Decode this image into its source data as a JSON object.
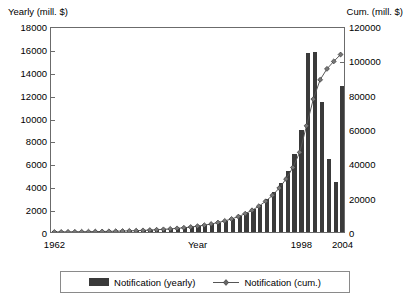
{
  "chart_data": {
    "type": "bar",
    "title": "",
    "xlabel": "Year",
    "ylabel": "Yearly (mill. $)",
    "y2label": "Cum. (mill. $)",
    "ylim": [
      0,
      18000
    ],
    "y2lim": [
      0,
      120000
    ],
    "yticks": [
      0,
      2000,
      4000,
      6000,
      8000,
      10000,
      12000,
      14000,
      16000,
      18000
    ],
    "ytick_labels": [
      "0",
      "2000",
      "4000",
      "6000",
      "8000",
      "10000",
      "12000",
      "14000",
      "16000",
      "18000"
    ],
    "y2ticks": [
      0,
      20000,
      40000,
      60000,
      80000,
      100000,
      120000
    ],
    "y2tick_labels": [
      "0",
      "20000",
      "40000",
      "60000",
      "80000",
      "100000",
      "120000"
    ],
    "grid": false,
    "legend_position": "bottom",
    "categories": [
      "1962",
      "1963",
      "1964",
      "1965",
      "1966",
      "1967",
      "1968",
      "1969",
      "1970",
      "1971",
      "1972",
      "1973",
      "1974",
      "1975",
      "1976",
      "1977",
      "1978",
      "1979",
      "1980",
      "1981",
      "1982",
      "1983",
      "1984",
      "1985",
      "1986",
      "1987",
      "1988",
      "1989",
      "1990",
      "1991",
      "1992",
      "1993",
      "1994",
      "1995",
      "1996",
      "1997",
      "1998",
      "1999",
      "2000",
      "2001",
      "2002",
      "2003",
      "2004"
    ],
    "xtick_labels": [
      "1962",
      "1998",
      "2004"
    ],
    "xtick_categories": [
      "1962",
      "1998",
      "2004"
    ],
    "series": [
      {
        "name": "Notification (yearly)",
        "axis": "left",
        "kind": "bar",
        "color": "#3a3a3a",
        "values": [
          20,
          25,
          30,
          35,
          40,
          45,
          55,
          60,
          70,
          80,
          95,
          110,
          130,
          150,
          175,
          200,
          230,
          270,
          310,
          360,
          420,
          500,
          590,
          700,
          830,
          980,
          1150,
          1400,
          1700,
          2000,
          2400,
          2900,
          3500,
          4300,
          5300,
          6800,
          8900,
          15600,
          15700,
          11400,
          6400,
          4400,
          12800
        ]
      },
      {
        "name": "Notification (cum.)",
        "axis": "right",
        "kind": "line",
        "color": "#555555",
        "marker": "diamond",
        "values": [
          20,
          45,
          75,
          110,
          150,
          195,
          250,
          310,
          380,
          460,
          555,
          665,
          795,
          945,
          1120,
          1320,
          1550,
          1820,
          2130,
          2490,
          2910,
          3410,
          4000,
          4700,
          5530,
          6510,
          7660,
          9060,
          10760,
          12760,
          15160,
          18060,
          21560,
          25860,
          31160,
          37960,
          46860,
          62460,
          78160,
          89560,
          95960,
          100360,
          104400
        ]
      }
    ]
  },
  "legend": {
    "items": [
      {
        "label": "Notification (yearly)",
        "type": "bar"
      },
      {
        "label": "Notification (cum.)",
        "type": "line"
      }
    ]
  }
}
